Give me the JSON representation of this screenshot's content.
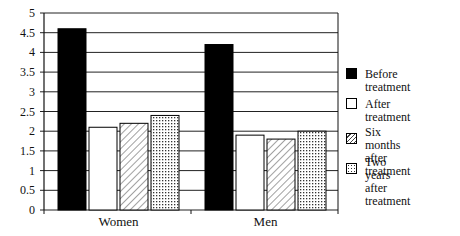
{
  "chart_data": {
    "type": "bar",
    "title": "",
    "xlabel": "",
    "ylabel": "",
    "ylim": [
      0,
      5
    ],
    "yticks": [
      "0",
      "0.5",
      "1",
      "1.5",
      "2",
      "2.5",
      "3",
      "3.5",
      "4",
      "4.5",
      "5"
    ],
    "grid": true,
    "legend_position": "right",
    "categories": [
      "Women",
      "Men"
    ],
    "series": [
      {
        "name": "Before treatment",
        "values": [
          4.6,
          4.2
        ],
        "fill": "black"
      },
      {
        "name": "After treatment",
        "values": [
          2.1,
          1.9
        ],
        "fill": "white"
      },
      {
        "name": "Six months after treatment",
        "values": [
          2.2,
          1.8
        ],
        "fill": "hatch"
      },
      {
        "name": "Two years after treatment",
        "values": [
          2.4,
          2.0
        ],
        "fill": "dots"
      }
    ]
  },
  "legend": [
    {
      "line1": "Before treatment",
      "line2": ""
    },
    {
      "line1": "After treatment",
      "line2": ""
    },
    {
      "line1": "Six months",
      "line2": "after treatment"
    },
    {
      "line1": "Two years after",
      "line2": "treatment"
    }
  ]
}
